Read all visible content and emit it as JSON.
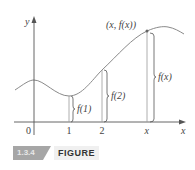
{
  "figure": {
    "number": "1.3.4",
    "word": "FIGURE"
  },
  "axes": {
    "y_label": "y",
    "x_label": "x",
    "origin_label": "0",
    "ticks": [
      {
        "label": "1",
        "x": 1
      },
      {
        "label": "2",
        "x": 2
      },
      {
        "label": "x",
        "x": "x"
      }
    ]
  },
  "point_label": "(x, f(x))",
  "annotations": [
    {
      "label": "f(1)",
      "at": 1
    },
    {
      "label": "f(2)",
      "at": 2
    },
    {
      "label": "f(x)",
      "at": "x"
    }
  ],
  "colors": {
    "curve": "#8a8a8a",
    "axes": "#555555",
    "badge_bg": "#a6a6a6",
    "text": "#444444"
  }
}
